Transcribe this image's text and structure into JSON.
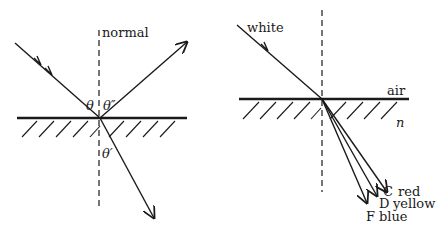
{
  "left_diagram": {
    "title": "reflection and refraction at interface",
    "normal_label": "normal",
    "angles": {
      "incident": "θ",
      "reflected": "θ″",
      "refracted": "θ′"
    }
  },
  "right_diagram": {
    "title": "dispersion of white light",
    "incident_label": "white",
    "upper_medium": "air",
    "lower_medium": "n",
    "rays": [
      {
        "line": "C",
        "color": "red"
      },
      {
        "line": "D",
        "color": "yellow"
      },
      {
        "line": "F",
        "color": "blue"
      }
    ]
  },
  "colors": {
    "ink": "#1a1a1a",
    "background": "#ffffff"
  }
}
